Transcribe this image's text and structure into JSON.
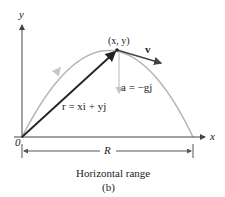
{
  "diagram": {
    "axes": {
      "x_label": "x",
      "y_label": "y",
      "origin_label": "0"
    },
    "point_label": "(x, y)",
    "velocity_label": "v",
    "acceleration_label": "a = −gj",
    "position_label": "r = xi + yj",
    "range_label": "R",
    "caption": "Horizontal range",
    "subfigure": "(b)",
    "colors": {
      "trajectory": "#b5b5b5",
      "vectors": "#333333",
      "axes": "#444444",
      "text": "#222222",
      "accel": "#c8c8c8"
    }
  }
}
